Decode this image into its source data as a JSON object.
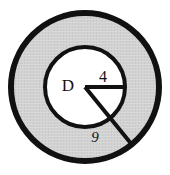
{
  "figure": {
    "kind": "geometry-diagram",
    "background_color": "#ffffff",
    "annulus_fill_color": "#d2d2d2",
    "inner_fill_color": "#ffffff",
    "stroke_color": "#111111",
    "outer_circle": {
      "center_x": 85,
      "center_y": 87,
      "radius": 74,
      "stroke_width": 6
    },
    "inner_circle": {
      "center_x": 85,
      "center_y": 87,
      "radius": 40,
      "stroke_width": 4
    },
    "center_point": {
      "x": 85,
      "y": 87
    },
    "segments": [
      {
        "name": "inner-radius-segment",
        "x1": 85,
        "y1": 87,
        "x2": 124,
        "y2": 87,
        "stroke_width": 4
      },
      {
        "name": "long-radius-segment",
        "x1": 85,
        "y1": 87,
        "x2": 133,
        "y2": 146,
        "stroke_width": 4
      }
    ],
    "labels": {
      "center": "D",
      "inner_radius": "4",
      "long_segment": "9"
    },
    "label_positions": {
      "center": {
        "x": 68,
        "y": 87
      },
      "inner_radius": {
        "x": 99,
        "y": 84
      },
      "long_segment": {
        "x": 91,
        "y": 141
      }
    }
  }
}
